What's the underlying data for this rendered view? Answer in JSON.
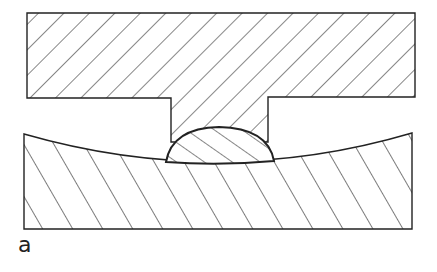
{
  "figure": {
    "label": "a",
    "colors": {
      "stroke": "#222222",
      "background": "#ffffff"
    }
  }
}
